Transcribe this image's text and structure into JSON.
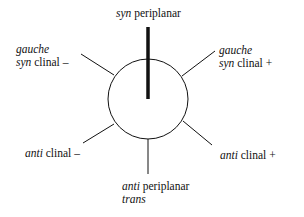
{
  "diagram": {
    "type": "newman-projection-conformations",
    "circle": {
      "cx": 148,
      "cy": 99,
      "r": 40
    },
    "bonds": [
      {
        "name": "syn-periplanar-bond",
        "x1": 148,
        "y1": 27,
        "x2": 148,
        "y2": 99,
        "width": 3.5,
        "bold": true
      },
      {
        "name": "gauche-syn-clinal-minus-bond",
        "x1": 81,
        "y1": 54,
        "x2": 114,
        "y2": 75,
        "width": 1
      },
      {
        "name": "gauche-syn-clinal-plus-bond",
        "x1": 215,
        "y1": 51,
        "x2": 182,
        "y2": 76,
        "width": 1
      },
      {
        "name": "anti-clinal-minus-bond",
        "x1": 83,
        "y1": 143,
        "x2": 114,
        "y2": 124,
        "width": 1
      },
      {
        "name": "anti-clinal-plus-bond",
        "x1": 212,
        "y1": 145,
        "x2": 183,
        "y2": 121,
        "width": 1
      },
      {
        "name": "anti-periplanar-bond",
        "x1": 148,
        "y1": 139,
        "x2": 148,
        "y2": 174,
        "width": 1
      }
    ],
    "colors": {
      "stroke": "#111111",
      "background": "#ffffff"
    }
  },
  "labels": {
    "syn_periplanar": {
      "italic": "syn",
      "plain": " periplanar"
    },
    "gauche_syn_clinal_minus": {
      "line1_italic": "gauche",
      "line2_italic": "syn",
      "line2_plain": " clinal –"
    },
    "gauche_syn_clinal_plus": {
      "line1_italic": "gauche",
      "line2_italic": "syn",
      "line2_plain": " clinal +"
    },
    "anti_clinal_minus": {
      "italic": "anti",
      "plain": " clinal –"
    },
    "anti_clinal_plus": {
      "italic": "anti",
      "plain": " clinal +"
    },
    "anti_periplanar": {
      "line1_italic": "anti",
      "line1_plain": " periplanar",
      "line2_italic": "trans"
    }
  }
}
